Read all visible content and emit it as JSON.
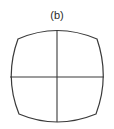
{
  "figure": {
    "panel_label": "(b)",
    "stroke_color": "#3a3a3a",
    "background": "#ffffff"
  }
}
